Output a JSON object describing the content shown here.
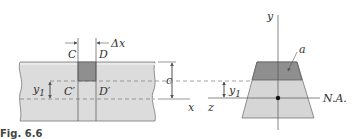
{
  "figure": {
    "caption": "Fig. 6.6",
    "colors": {
      "beam_fill": "#dcdcdc",
      "element_fill": "#8f8f8f",
      "section_light": "#d6d6d6",
      "section_dark": "#8f8f8f",
      "line": "#555555",
      "dashed": "#666666"
    }
  },
  "beam_view": {
    "labels": {
      "C": "C",
      "D": "D",
      "delta_x": "Δx",
      "C_prime": "C′",
      "D_prime": "D′",
      "y1": "y",
      "y1_sub": "1",
      "c": "c",
      "x_axis": "x"
    }
  },
  "section_view": {
    "labels": {
      "y_axis": "y",
      "z_axis": "z",
      "area": "a",
      "y1": "y",
      "y1_sub": "1",
      "neutral_axis": "N.A."
    }
  }
}
